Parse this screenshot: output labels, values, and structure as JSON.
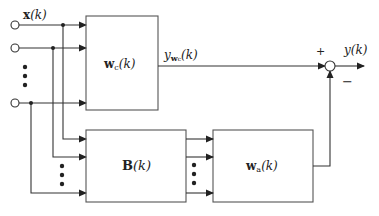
{
  "diagram": {
    "type": "block-diagram",
    "colors": {
      "line": "#333333",
      "box": "#555555",
      "background": "#ffffff"
    },
    "inputs": {
      "label_var": "x",
      "label_arg": "(k)",
      "ellipsis": "⋮"
    },
    "blocks": {
      "wc": {
        "var": "w",
        "sub": "c",
        "arg": "(k)"
      },
      "B": {
        "var": "B",
        "arg": "(k)"
      },
      "wa": {
        "var": "w",
        "sub": "a",
        "arg": "(k)"
      }
    },
    "signals": {
      "ywc": {
        "var": "y",
        "sub_var": "w",
        "sub_sub": "c",
        "arg": "(k)"
      },
      "output": {
        "var": "y",
        "arg": "(k)"
      }
    },
    "summing_junction": {
      "plus": "+",
      "minus": "−"
    }
  }
}
